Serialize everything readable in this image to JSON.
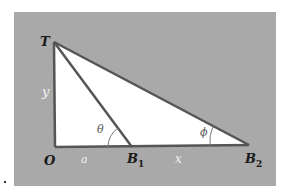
{
  "diagram": {
    "type": "geometry",
    "colors": {
      "panel": "#a9a9a9",
      "triangle_fill": "#ffffff",
      "lines": "#555555"
    },
    "points": {
      "T": {
        "label": "T"
      },
      "O": {
        "label": "O"
      },
      "B1": {
        "label": "B",
        "sub": "1"
      },
      "B2": {
        "label": "B",
        "sub": "2"
      }
    },
    "segments": {
      "y": {
        "label": "y"
      },
      "a": {
        "label": "a"
      },
      "x": {
        "label": "x"
      }
    },
    "angles": {
      "theta": {
        "label": "θ"
      },
      "phi": {
        "label": "ϕ"
      }
    }
  }
}
